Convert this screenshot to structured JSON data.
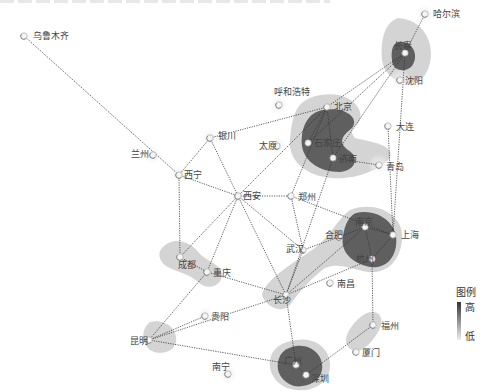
{
  "map": {
    "colors": {
      "heat_low": "#d4d4d4",
      "heat_mid": "#9a9a9a",
      "heat_high": "#555555",
      "link": "#333333",
      "label": "#444444"
    },
    "cities": [
      {
        "name": "乌鲁木齐",
        "x": 24,
        "y": 36,
        "lx": 33,
        "ly": 39,
        "glow": 0
      },
      {
        "name": "哈尔滨",
        "x": 425,
        "y": 14,
        "lx": 433,
        "ly": 17,
        "glow": 1
      },
      {
        "name": "长春",
        "x": 405,
        "y": 53,
        "lx": 394,
        "ly": 49,
        "glow": 0
      },
      {
        "name": "沈阳",
        "x": 400,
        "y": 80,
        "lx": 405,
        "ly": 84,
        "glow": 1
      },
      {
        "name": "呼和浩特",
        "x": 279,
        "y": 105,
        "lx": 274,
        "ly": 95,
        "glow": 1
      },
      {
        "name": "北京",
        "x": 327,
        "y": 107,
        "lx": 334,
        "ly": 110,
        "glow": 0
      },
      {
        "name": "大连",
        "x": 388,
        "y": 126,
        "lx": 396,
        "ly": 130,
        "glow": 0
      },
      {
        "name": "银川",
        "x": 210,
        "y": 138,
        "lx": 218,
        "ly": 139,
        "glow": 1
      },
      {
        "name": "兰州",
        "x": 153,
        "y": 155,
        "lx": 131,
        "ly": 157,
        "glow": 1
      },
      {
        "name": "太原",
        "x": 277,
        "y": 146,
        "lx": 259,
        "ly": 149,
        "glow": 1
      },
      {
        "name": "石家庄",
        "x": 308,
        "y": 143,
        "lx": 314,
        "ly": 146,
        "glow": 0
      },
      {
        "name": "济南",
        "x": 333,
        "y": 158,
        "lx": 339,
        "ly": 162,
        "glow": 0
      },
      {
        "name": "青岛",
        "x": 379,
        "y": 165,
        "lx": 386,
        "ly": 170,
        "glow": 1
      },
      {
        "name": "西宁",
        "x": 179,
        "y": 175,
        "lx": 184,
        "ly": 178,
        "glow": 1
      },
      {
        "name": "西安",
        "x": 238,
        "y": 196,
        "lx": 243,
        "ly": 199,
        "glow": 1
      },
      {
        "name": "郑州",
        "x": 291,
        "y": 196,
        "lx": 298,
        "ly": 200,
        "glow": 0
      },
      {
        "name": "南京",
        "x": 365,
        "y": 227,
        "lx": 355,
        "ly": 225,
        "glow": 0
      },
      {
        "name": "合肥",
        "x": 339,
        "y": 237,
        "lx": 325,
        "ly": 238,
        "glow": 0
      },
      {
        "name": "上海",
        "x": 393,
        "y": 235,
        "lx": 401,
        "ly": 238,
        "glow": 0
      },
      {
        "name": "武汉",
        "x": 303,
        "y": 250,
        "lx": 286,
        "ly": 252,
        "glow": 0
      },
      {
        "name": "杭州",
        "x": 372,
        "y": 259,
        "lx": 356,
        "ly": 262,
        "glow": 0
      },
      {
        "name": "成都",
        "x": 180,
        "y": 257,
        "lx": 178,
        "ly": 268,
        "glow": 0
      },
      {
        "name": "重庆",
        "x": 207,
        "y": 272,
        "lx": 213,
        "ly": 276,
        "glow": 0
      },
      {
        "name": "南昌",
        "x": 330,
        "y": 283,
        "lx": 337,
        "ly": 287,
        "glow": 0
      },
      {
        "name": "长沙",
        "x": 286,
        "y": 295,
        "lx": 273,
        "ly": 303,
        "glow": 0
      },
      {
        "name": "福州",
        "x": 373,
        "y": 325,
        "lx": 381,
        "ly": 329,
        "glow": 0
      },
      {
        "name": "贵阳",
        "x": 205,
        "y": 316,
        "lx": 211,
        "ly": 320,
        "glow": 1
      },
      {
        "name": "昆明",
        "x": 149,
        "y": 340,
        "lx": 130,
        "ly": 344,
        "glow": 0
      },
      {
        "name": "厦门",
        "x": 356,
        "y": 352,
        "lx": 362,
        "ly": 356,
        "glow": 0
      },
      {
        "name": "南宁",
        "x": 228,
        "y": 374,
        "lx": 212,
        "ly": 370,
        "glow": 1
      },
      {
        "name": "广州",
        "x": 296,
        "y": 365,
        "lx": 284,
        "ly": 364,
        "glow": 0
      },
      {
        "name": "深圳",
        "x": 306,
        "y": 375,
        "lx": 311,
        "ly": 382,
        "glow": 0
      }
    ],
    "links": [
      [
        "乌鲁木齐",
        "西宁"
      ],
      [
        "哈尔滨",
        "长春"
      ],
      [
        "长春",
        "北京"
      ],
      [
        "长春",
        "济南"
      ],
      [
        "长春",
        "上海"
      ],
      [
        "长春",
        "石家庄"
      ],
      [
        "北京",
        "银川"
      ],
      [
        "北京",
        "石家庄"
      ],
      [
        "北京",
        "济南"
      ],
      [
        "北京",
        "西安"
      ],
      [
        "北京",
        "郑州"
      ],
      [
        "济南",
        "青岛"
      ],
      [
        "济南",
        "长沙"
      ],
      [
        "银川",
        "西宁"
      ],
      [
        "银川",
        "西安"
      ],
      [
        "西宁",
        "西安"
      ],
      [
        "西宁",
        "成都"
      ],
      [
        "西安",
        "郑州"
      ],
      [
        "西安",
        "成都"
      ],
      [
        "西安",
        "重庆"
      ],
      [
        "西安",
        "武汉"
      ],
      [
        "西安",
        "长沙"
      ],
      [
        "郑州",
        "武汉"
      ],
      [
        "郑州",
        "上海"
      ],
      [
        "大连",
        "上海"
      ],
      [
        "武汉",
        "合肥"
      ],
      [
        "武汉",
        "长沙"
      ],
      [
        "合肥",
        "南京"
      ],
      [
        "南京",
        "上海"
      ],
      [
        "南京",
        "杭州"
      ],
      [
        "上海",
        "杭州"
      ],
      [
        "长沙",
        "南京"
      ],
      [
        "长沙",
        "杭州"
      ],
      [
        "长沙",
        "重庆"
      ],
      [
        "长沙",
        "昆明"
      ],
      [
        "长沙",
        "广州"
      ],
      [
        "成都",
        "重庆"
      ],
      [
        "重庆",
        "昆明"
      ],
      [
        "杭州",
        "福州"
      ],
      [
        "福州",
        "深圳"
      ],
      [
        "昆明",
        "贵阳"
      ],
      [
        "昆明",
        "广州"
      ],
      [
        "广州",
        "深圳"
      ]
    ],
    "heat_zones": [
      {
        "name": "northeast",
        "low": "M398 18 C430 20 438 55 425 75 C410 92 385 80 382 60 C380 40 385 22 398 18 Z",
        "high": "M398 42 C412 40 420 55 412 66 C404 74 392 70 392 60 C391 52 392 44 398 42 Z"
      },
      {
        "name": "beijing",
        "low": "M310 98 C330 90 355 95 360 112 C364 128 345 125 355 138 C372 142 395 145 390 158 C380 170 355 180 332 178 C305 176 288 160 290 140 C292 118 295 104 310 98 Z",
        "high": "M323 110 C345 106 360 118 352 128 C342 136 338 142 348 150 C358 156 358 170 340 172 C318 172 304 160 302 146 C300 128 308 112 323 110 Z"
      },
      {
        "name": "yangtze",
        "low": "M350 210 C375 200 405 214 402 240 C400 262 386 274 368 272 C352 270 340 262 325 268 C315 275 300 290 290 305 C280 315 265 305 262 295 C265 280 290 265 312 250 C330 238 338 218 350 210 Z",
        "high": "M356 213 C378 208 400 224 396 246 C393 265 378 270 366 266 C352 262 340 252 343 236 C345 224 349 216 356 213 Z"
      },
      {
        "name": "sichuan",
        "low": "M162 248 C172 236 190 240 200 254 C208 262 222 264 222 276 C220 288 206 290 198 282 C190 274 176 272 166 266 C158 260 158 252 162 248 Z",
        "high": ""
      },
      {
        "name": "kunming",
        "low": "M150 322 C166 318 178 330 176 342 C174 352 160 356 150 350 C142 344 140 330 150 322 Z",
        "high": ""
      },
      {
        "name": "fujian",
        "low": "M372 312 C382 312 384 322 378 332 C370 346 360 354 352 350 C344 346 344 336 352 326 C358 318 366 312 372 312 Z",
        "high": ""
      },
      {
        "name": "guangdong",
        "low": "M296 340 C318 336 332 352 330 368 C328 384 312 392 296 390 C278 388 268 374 270 360 C272 348 282 342 296 340 Z",
        "high": "M296 346 C312 344 324 356 322 370 C320 382 306 388 294 386 C282 382 276 372 278 362 C280 352 286 348 296 346 Z"
      }
    ]
  },
  "legend": {
    "title": "图例",
    "high_label": "高",
    "low_label": "低"
  }
}
